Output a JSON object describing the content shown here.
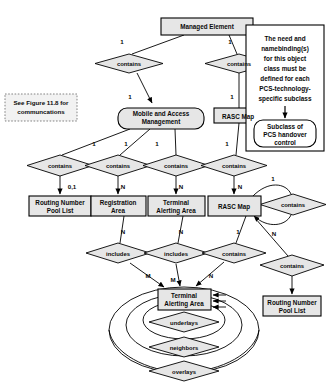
{
  "figure": {
    "type": "entity-relationship-diagram",
    "background_color": "#ffffff",
    "entity_fill": "#e6e6e6",
    "relationship_fill": "#e6e6e6",
    "stroke_color": "#000000"
  },
  "entities": [
    {
      "id": "managed_element",
      "label": "Managed Element",
      "shape": "rect",
      "x": 161,
      "y": 18,
      "w": 92,
      "h": 17
    },
    {
      "id": "mobile_access_mgmt",
      "label": "Mobile and Access Management",
      "shape": "rounded-rect",
      "x": 118,
      "y": 108,
      "w": 86,
      "h": 21
    },
    {
      "id": "rasc_map_top",
      "label": "RASC Map",
      "shape": "rect",
      "x": 214,
      "y": 108,
      "w": 49,
      "h": 15
    },
    {
      "id": "routing_pool_left",
      "label": "Routing Number Pool List",
      "shape": "rect",
      "x": 47,
      "y": 196,
      "w": 62,
      "h": 20
    },
    {
      "id": "registration_area",
      "label": "Registration Area",
      "shape": "rect",
      "x": 116,
      "y": 196,
      "w": 55,
      "h": 20
    },
    {
      "id": "terminal_alerting_mid",
      "label": "Terminal Alerting Area",
      "shape": "rect",
      "x": 178,
      "y": 196,
      "w": 57,
      "h": 20
    },
    {
      "id": "rasc_map_mid",
      "label": "RASC Map",
      "shape": "rect",
      "x": 243,
      "y": 196,
      "w": 53,
      "h": 20
    },
    {
      "id": "terminal_alerting_bot",
      "label": "Terminal Alerting Area",
      "shape": "rect",
      "x": 158,
      "y": 289,
      "w": 53,
      "h": 21
    },
    {
      "id": "routing_pool_right",
      "label": "Routing Number Pool List",
      "shape": "rect",
      "x": 275,
      "y": 296,
      "w": 58,
      "h": 20
    }
  ],
  "relationships": [
    {
      "id": "rel_me_mam",
      "label": "contains",
      "x": 129,
      "y": 63
    },
    {
      "id": "rel_me_rasc",
      "label": "contains",
      "x": 239,
      "y": 63
    },
    {
      "id": "rel_rpl",
      "label": "contains",
      "x": 60,
      "y": 165
    },
    {
      "id": "rel_reg",
      "label": "contains",
      "x": 118,
      "y": 165
    },
    {
      "id": "rel_taa",
      "label": "contains",
      "x": 176,
      "y": 165
    },
    {
      "id": "rel_rascmid",
      "label": "contains",
      "x": 234,
      "y": 165
    },
    {
      "id": "rel_rasc_self",
      "label": "contains",
      "x": 293,
      "y": 204
    },
    {
      "id": "rel_reg_inc",
      "label": "includes",
      "x": 118,
      "y": 253
    },
    {
      "id": "rel_taa_inc",
      "label": "includes",
      "x": 176,
      "y": 253
    },
    {
      "id": "rel_rasc_cont",
      "label": "contains",
      "x": 234,
      "y": 253
    },
    {
      "id": "rel_rpl2",
      "label": "contains",
      "x": 292,
      "y": 265
    },
    {
      "id": "rel_underlays",
      "label": "underlays",
      "x": 184,
      "y": 322
    },
    {
      "id": "rel_neighbors",
      "label": "neighbors",
      "x": 184,
      "y": 347
    },
    {
      "id": "rel_overlays",
      "label": "overlays",
      "x": 184,
      "y": 371
    }
  ],
  "cardinalities": [
    {
      "id": "card_1_me_left",
      "label": "1",
      "x": 122,
      "y": 44
    },
    {
      "id": "card_1_me_right",
      "label": "1",
      "x": 230,
      "y": 44
    },
    {
      "id": "card_1_mam",
      "label": "1",
      "x": 130,
      "y": 99
    },
    {
      "id": "card_1_rascmaptop",
      "label": "1",
      "x": 232,
      "y": 99
    },
    {
      "id": "card_1_mam_a",
      "label": "1",
      "x": 94,
      "y": 146
    },
    {
      "id": "card_1_mam_b",
      "label": "1",
      "x": 126,
      "y": 146
    },
    {
      "id": "card_1_mam_c",
      "label": "1",
      "x": 157,
      "y": 146
    },
    {
      "id": "card_1_rasc_dn",
      "label": "1",
      "x": 227,
      "y": 146
    },
    {
      "id": "card_01_rpl",
      "label": "0,1",
      "x": 72,
      "y": 186
    },
    {
      "id": "card_n_reg",
      "label": "N",
      "x": 123,
      "y": 186
    },
    {
      "id": "card_n_taa",
      "label": "N",
      "x": 181,
      "y": 186
    },
    {
      "id": "card_n_rascmid",
      "label": "N",
      "x": 240,
      "y": 186
    },
    {
      "id": "card_1_selfup",
      "label": "1",
      "x": 273,
      "y": 178
    },
    {
      "id": "card_n_selfdn",
      "label": "N",
      "x": 274,
      "y": 233
    },
    {
      "id": "card_n_reg_dn",
      "label": "N",
      "x": 123,
      "y": 231
    },
    {
      "id": "card_n_taa_dn",
      "label": "N",
      "x": 181,
      "y": 231
    },
    {
      "id": "card_1_rasc_dn2",
      "label": "1",
      "x": 238,
      "y": 231
    },
    {
      "id": "card_m_reg",
      "label": "M",
      "x": 148,
      "y": 275
    },
    {
      "id": "card_m_taa",
      "label": "M",
      "x": 173,
      "y": 279
    },
    {
      "id": "card_n_rasc_bot",
      "label": "N",
      "x": 211,
      "y": 275
    }
  ],
  "note": {
    "id": "note_box",
    "lines": [
      "The need and",
      "namebinding(s)",
      "for this object",
      "class must be",
      "defined for each",
      "PCS-technology-",
      "specific subclass"
    ],
    "subclass_box": {
      "id": "subclass_box",
      "lines": [
        "Subclass of",
        "PCS handover",
        "control"
      ]
    }
  },
  "reference_note": {
    "id": "figure_reference",
    "lines": [
      "See Figure 11.8 for",
      "communcations"
    ]
  }
}
